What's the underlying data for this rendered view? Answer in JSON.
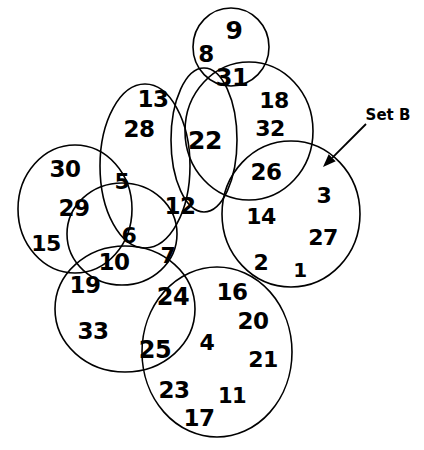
{
  "figure": {
    "type": "venn-diagram",
    "title": "",
    "background_color": "#ffffff",
    "stroke_color": "#000000",
    "text_color": "#000000"
  },
  "annotations": [
    {
      "id": "set-b",
      "label": "Set B",
      "x": 388,
      "y": 115,
      "arrow_from_x": 366,
      "arrow_from_y": 124,
      "arrow_to_x": 323,
      "arrow_to_y": 167
    }
  ],
  "circles": [
    {
      "id": "circle-top-small",
      "cx": 231,
      "cy": 47,
      "rx": 38,
      "ry": 39
    },
    {
      "id": "circle-upper-left",
      "cx": 145,
      "cy": 166,
      "rx": 45,
      "ry": 82
    },
    {
      "id": "circle-middle-oval",
      "cx": 204,
      "cy": 140,
      "rx": 33,
      "ry": 72
    },
    {
      "id": "circle-upper-right",
      "cx": 249,
      "cy": 131,
      "rx": 64,
      "ry": 69
    },
    {
      "id": "circle-left",
      "cx": 75,
      "cy": 209,
      "rx": 57,
      "ry": 64
    },
    {
      "id": "circle-center-small",
      "cx": 122,
      "cy": 234,
      "rx": 55,
      "ry": 51
    },
    {
      "id": "circle-set-b",
      "cx": 291,
      "cy": 214,
      "rx": 69,
      "ry": 73
    },
    {
      "id": "circle-bottom-left",
      "cx": 125,
      "cy": 309,
      "rx": 70,
      "ry": 63
    },
    {
      "id": "circle-bottom-right",
      "cx": 217,
      "cy": 352,
      "rx": 75,
      "ry": 85
    }
  ],
  "numbers": [
    {
      "value": "9",
      "x": 234,
      "y": 30,
      "size": 25
    },
    {
      "value": "8",
      "x": 206,
      "y": 54,
      "size": 23
    },
    {
      "value": "31",
      "x": 232,
      "y": 78,
      "size": 24
    },
    {
      "value": "13",
      "x": 153,
      "y": 99,
      "size": 23
    },
    {
      "value": "18",
      "x": 274,
      "y": 101,
      "size": 22
    },
    {
      "value": "28",
      "x": 139,
      "y": 129,
      "size": 23
    },
    {
      "value": "22",
      "x": 205,
      "y": 140,
      "size": 25
    },
    {
      "value": "32",
      "x": 270,
      "y": 129,
      "size": 22
    },
    {
      "value": "30",
      "x": 65,
      "y": 169,
      "size": 23
    },
    {
      "value": "5",
      "x": 122,
      "y": 182,
      "size": 22
    },
    {
      "value": "26",
      "x": 266,
      "y": 172,
      "size": 23
    },
    {
      "value": "3",
      "x": 324,
      "y": 196,
      "size": 22
    },
    {
      "value": "29",
      "x": 74,
      "y": 208,
      "size": 23
    },
    {
      "value": "12",
      "x": 180,
      "y": 206,
      "size": 23
    },
    {
      "value": "14",
      "x": 261,
      "y": 217,
      "size": 22
    },
    {
      "value": "15",
      "x": 46,
      "y": 244,
      "size": 22
    },
    {
      "value": "6",
      "x": 129,
      "y": 236,
      "size": 22
    },
    {
      "value": "27",
      "x": 323,
      "y": 238,
      "size": 22
    },
    {
      "value": "10",
      "x": 114,
      "y": 262,
      "size": 23
    },
    {
      "value": "7",
      "x": 168,
      "y": 256,
      "size": 22
    },
    {
      "value": "2",
      "x": 261,
      "y": 263,
      "size": 22
    },
    {
      "value": "1",
      "x": 300,
      "y": 270,
      "size": 20
    },
    {
      "value": "19",
      "x": 85,
      "y": 285,
      "size": 23
    },
    {
      "value": "24",
      "x": 173,
      "y": 297,
      "size": 24
    },
    {
      "value": "16",
      "x": 232,
      "y": 292,
      "size": 23
    },
    {
      "value": "20",
      "x": 253,
      "y": 321,
      "size": 23
    },
    {
      "value": "33",
      "x": 93,
      "y": 331,
      "size": 23
    },
    {
      "value": "25",
      "x": 155,
      "y": 350,
      "size": 24
    },
    {
      "value": "4",
      "x": 207,
      "y": 343,
      "size": 22
    },
    {
      "value": "21",
      "x": 263,
      "y": 360,
      "size": 22
    },
    {
      "value": "23",
      "x": 174,
      "y": 390,
      "size": 23
    },
    {
      "value": "11",
      "x": 232,
      "y": 396,
      "size": 21
    },
    {
      "value": "17",
      "x": 199,
      "y": 418,
      "size": 23
    }
  ]
}
